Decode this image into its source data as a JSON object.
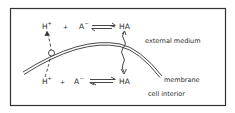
{
  "diagram": {
    "outer": {
      "top": {
        "hplus": "H",
        "hplus_sup": "+",
        "plus": "+",
        "aminus": "A",
        "aminus_sup": "−",
        "ha": "HA"
      },
      "region_label": "external medium"
    },
    "inner": {
      "bottom": {
        "hplus": "H",
        "hplus_sup": "+",
        "plus": "+",
        "aminus": "A",
        "aminus_sup": "−",
        "ha": "HA"
      },
      "region_label": "cell interior"
    },
    "membrane_label": "membrane"
  }
}
